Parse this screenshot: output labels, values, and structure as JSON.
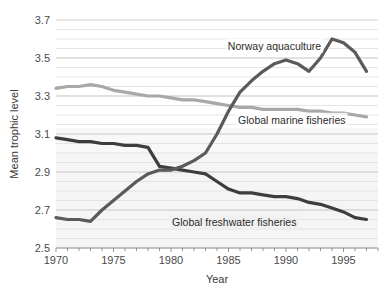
{
  "chart_data": {
    "type": "line",
    "title": "",
    "xlabel": "Year",
    "ylabel": "Mean trophic level",
    "xlim": [
      1970,
      1998
    ],
    "ylim": [
      2.5,
      3.7
    ],
    "xticks": [
      1970,
      1975,
      1980,
      1985,
      1990,
      1995
    ],
    "xtick_labels": [
      "1970",
      "1975",
      "1980",
      "1985",
      "1990",
      "1995"
    ],
    "yticks": [
      2.5,
      2.7,
      2.9,
      3.1,
      3.3,
      3.5,
      3.7
    ],
    "ytick_labels": [
      "2.5",
      "2.7",
      "2.9",
      "3.1",
      "3.3",
      "3.5",
      "3.7"
    ],
    "minor_ytick_step": 0.05,
    "minor_xtick_step": 1,
    "grid": true,
    "grid_color": "#d8d8d8",
    "legend_position": "inline-annotations",
    "x": [
      1970,
      1971,
      1972,
      1973,
      1974,
      1975,
      1976,
      1977,
      1978,
      1979,
      1980,
      1981,
      1982,
      1983,
      1984,
      1985,
      1986,
      1987,
      1988,
      1989,
      1990,
      1991,
      1992,
      1993,
      1994,
      1995,
      1996,
      1997
    ],
    "series": [
      {
        "name": "Norway aquaculture",
        "color": "#5a5a5a",
        "label_text": "Norway aquaculture",
        "values": [
          2.66,
          2.65,
          2.65,
          2.64,
          2.7,
          2.75,
          2.8,
          2.85,
          2.89,
          2.91,
          2.91,
          2.93,
          2.96,
          3.0,
          3.1,
          3.22,
          3.32,
          3.38,
          3.43,
          3.47,
          3.49,
          3.47,
          3.43,
          3.5,
          3.6,
          3.58,
          3.53,
          3.43
        ]
      },
      {
        "name": "Global marine fisheries",
        "color": "#a8a8a8",
        "label_text": "Global marine fisheries",
        "values": [
          3.34,
          3.35,
          3.35,
          3.36,
          3.35,
          3.33,
          3.32,
          3.31,
          3.3,
          3.3,
          3.29,
          3.28,
          3.28,
          3.27,
          3.26,
          3.25,
          3.24,
          3.24,
          3.23,
          3.23,
          3.23,
          3.23,
          3.22,
          3.22,
          3.21,
          3.21,
          3.2,
          3.19
        ]
      },
      {
        "name": "Global freshwater fisheries",
        "color": "#3d3d3d",
        "label_text": "Global freshwater fisheries",
        "values": [
          3.08,
          3.07,
          3.06,
          3.06,
          3.05,
          3.05,
          3.04,
          3.04,
          3.03,
          2.93,
          2.92,
          2.91,
          2.9,
          2.89,
          2.85,
          2.81,
          2.79,
          2.79,
          2.78,
          2.77,
          2.77,
          2.76,
          2.74,
          2.73,
          2.71,
          2.69,
          2.66,
          2.65
        ]
      }
    ],
    "annotations": [
      {
        "text": "Norway aquaculture",
        "x": 1989,
        "y": 3.565
      },
      {
        "text": "Global marine fisheries",
        "x": 1990.5,
        "y": 3.175
      },
      {
        "text": "Global freshwater fisheries",
        "x": 1985.5,
        "y": 2.635
      }
    ]
  }
}
